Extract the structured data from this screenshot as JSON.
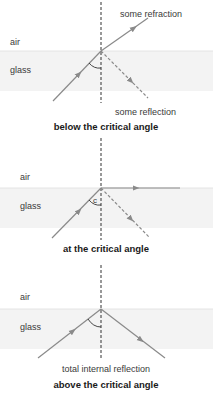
{
  "diagram": {
    "panels": [
      {
        "id": "below",
        "medium_top": "air",
        "medium_bottom": "glass",
        "caption": "below the critical angle",
        "labels": [
          "some refraction",
          "some reflection"
        ],
        "refracted_ray": "partial",
        "reflected_ray": "partial (dashed)"
      },
      {
        "id": "at",
        "medium_top": "air",
        "medium_bottom": "glass",
        "caption": "at the critical angle",
        "angle_label": "c",
        "refracted_ray": "along boundary",
        "reflected_ray": "partial (dashed)"
      },
      {
        "id": "above",
        "medium_top": "air",
        "medium_bottom": "glass",
        "caption": "above the critical angle",
        "labels": [
          "total internal reflection"
        ],
        "refracted_ray": "none",
        "reflected_ray": "total (solid)"
      }
    ],
    "colors": {
      "ray": "#8a8a8a",
      "normal": "#333333",
      "glass_fill": "#f3f3f3",
      "interface": "#e6e6e6"
    }
  }
}
